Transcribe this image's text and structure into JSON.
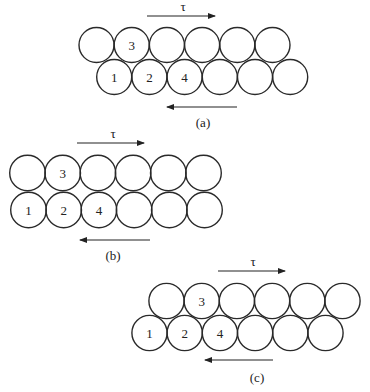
{
  "figure": {
    "shear_symbol": "τ",
    "stroke_color": "#2a2a2a",
    "panels": [
      {
        "caption": "(a)",
        "top_row": {
          "cx": [
            96.5,
            131.7,
            166.9,
            202.1,
            237.3,
            272.5
          ],
          "cy": 45,
          "labels": [
            "",
            "3",
            "",
            "",
            "",
            ""
          ]
        },
        "bottom_row": {
          "cx": [
            114.2,
            149.4,
            184.6,
            219.8,
            255.0,
            290.2
          ],
          "cy": 77,
          "labels": [
            "1",
            "2",
            "4",
            "",
            "",
            ""
          ]
        },
        "radius": 17.5,
        "top_arrow": {
          "x1": 147,
          "x2": 215,
          "y": 16,
          "dir": "right"
        },
        "tau_pos": {
          "x": 183,
          "y": 11
        },
        "bottom_arrow": {
          "x1": 167,
          "x2": 237,
          "y": 107,
          "dir": "left"
        },
        "caption_pos": {
          "x": 203,
          "y": 127
        }
      },
      {
        "caption": "(b)",
        "top_row": {
          "cx": [
            27.5,
            62.7,
            97.9,
            133.1,
            168.3,
            203.5
          ],
          "cy": 173,
          "labels": [
            "",
            "3",
            "",
            "",
            "",
            ""
          ]
        },
        "bottom_row": {
          "cx": [
            28.5,
            63.7,
            98.9,
            134.1,
            169.3,
            204.5
          ],
          "cy": 210,
          "labels": [
            "1",
            "2",
            "4",
            "",
            "",
            ""
          ]
        },
        "radius": 17.8,
        "top_arrow": {
          "x1": 77,
          "x2": 144,
          "y": 143,
          "dir": "right"
        },
        "tau_pos": {
          "x": 113,
          "y": 138
        },
        "bottom_arrow": {
          "x1": 80,
          "x2": 150,
          "y": 240,
          "dir": "left"
        },
        "caption_pos": {
          "x": 113,
          "y": 260
        }
      },
      {
        "caption": "(c)",
        "top_row": {
          "cx": [
            166.5,
            201.7,
            236.9,
            272.1,
            307.3,
            342.5
          ],
          "cy": 301,
          "labels": [
            "",
            "3",
            "",
            "",
            "",
            ""
          ]
        },
        "bottom_row": {
          "cx": [
            149.5,
            184.7,
            219.9,
            255.1,
            290.3,
            325.5
          ],
          "cy": 333,
          "labels": [
            "1",
            "2",
            "4",
            "",
            "",
            ""
          ]
        },
        "radius": 17.6,
        "top_arrow": {
          "x1": 218,
          "x2": 285,
          "y": 271,
          "dir": "right"
        },
        "tau_pos": {
          "x": 253,
          "y": 266
        },
        "bottom_arrow": {
          "x1": 205,
          "x2": 273,
          "y": 360,
          "dir": "left"
        },
        "caption_pos": {
          "x": 257,
          "y": 382
        }
      }
    ]
  }
}
